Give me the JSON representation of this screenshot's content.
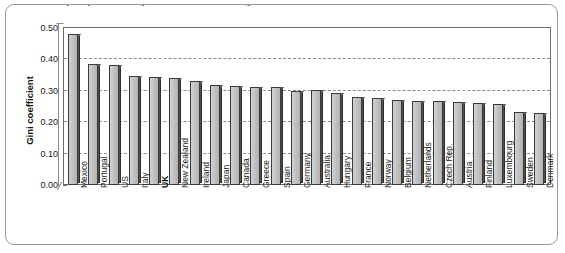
{
  "caption": "Income inequality is on average above the OECD average",
  "axes": {
    "y_title": "Gini coefficient",
    "y_ticks": [
      "0.00",
      "0.10",
      "0.20",
      "0.30",
      "0.40",
      "0.50"
    ],
    "y_min": 0.0,
    "y_max": 0.5,
    "grid": "dashed horizontal"
  },
  "chart_data": {
    "type": "bar",
    "title": "Income inequality is on average above the OECD average",
    "xlabel": "",
    "ylabel": "Gini coefficient",
    "ylim": [
      0.0,
      0.5
    ],
    "ytick_step": 0.1,
    "grid": true,
    "legend": "none",
    "highlight": "UK",
    "categories": [
      "Mexico",
      "Portugal",
      "US",
      "Italy",
      "UK",
      "New Zealand",
      "Ireland",
      "Japan",
      "Canada",
      "Greece",
      "Spain",
      "Germany",
      "Australia",
      "Hungary",
      "France",
      "Norway",
      "Belgium",
      "Netherlands",
      "Czech Rep.",
      "Austria",
      "Finland",
      "Luxembourg",
      "Sweden",
      "Denmark"
    ],
    "values": [
      0.48,
      0.385,
      0.383,
      0.347,
      0.345,
      0.342,
      0.33,
      0.317,
      0.315,
      0.313,
      0.312,
      0.3,
      0.302,
      0.292,
      0.281,
      0.277,
      0.271,
      0.268,
      0.267,
      0.265,
      0.261,
      0.258,
      0.232,
      0.228
    ],
    "series": [
      {
        "name": "Gini coefficient",
        "values": [
          0.48,
          0.385,
          0.383,
          0.347,
          0.345,
          0.342,
          0.33,
          0.317,
          0.315,
          0.313,
          0.312,
          0.3,
          0.302,
          0.292,
          0.281,
          0.277,
          0.271,
          0.268,
          0.267,
          0.265,
          0.261,
          0.258,
          0.232,
          0.228
        ]
      }
    ]
  },
  "colors": {
    "bar_face": "#c6c6c6",
    "bar_edge": "#3a3a3a",
    "bar_side": "#4f4f4f",
    "grid": "#8c8c8c",
    "frame": "#6d6d6d",
    "outer_border": "#9a9a9a"
  }
}
